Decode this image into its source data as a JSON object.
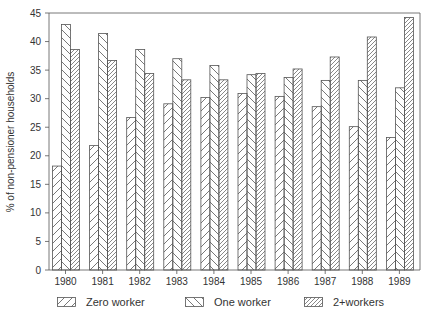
{
  "chart_data": {
    "type": "bar",
    "title": "",
    "xlabel": "",
    "ylabel": "% of non-pensioner households",
    "categories": [
      "1980",
      "1981",
      "1982",
      "1983",
      "1984",
      "1985",
      "1986",
      "1987",
      "1988",
      "1989"
    ],
    "series": [
      {
        "name": "Zero worker",
        "pattern": "hatch-forward",
        "values": [
          18.2,
          21.8,
          26.7,
          29.1,
          30.2,
          30.9,
          30.4,
          28.6,
          25.1,
          23.2
        ]
      },
      {
        "name": "One worker",
        "pattern": "hatch-backward",
        "values": [
          43.0,
          41.4,
          38.6,
          37.0,
          35.8,
          34.2,
          33.7,
          33.2,
          33.2,
          31.9
        ]
      },
      {
        "name": "2+workers",
        "pattern": "hatch-dense",
        "values": [
          38.6,
          36.7,
          34.4,
          33.3,
          33.3,
          34.4,
          35.2,
          37.3,
          40.8,
          44.2
        ]
      }
    ],
    "ylim": [
      0,
      45
    ],
    "yticks": [
      0,
      5,
      10,
      15,
      20,
      25,
      30,
      35,
      40,
      45
    ],
    "grid": false,
    "legend_position": "bottom"
  },
  "legend": {
    "items": [
      {
        "label": "Zero worker",
        "pattern": "hatch-forward"
      },
      {
        "label": "One worker",
        "pattern": "hatch-backward"
      },
      {
        "label": "2+workers",
        "pattern": "hatch-dense"
      }
    ]
  },
  "colors": {
    "line": "#555555",
    "background": "#ffffff"
  }
}
